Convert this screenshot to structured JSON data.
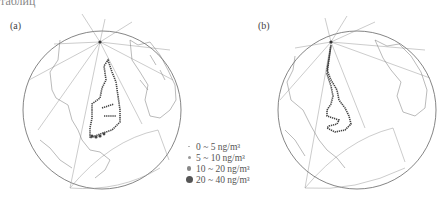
{
  "figure": {
    "top_cut_text": "таблиц",
    "panels": [
      {
        "label": "(a)"
      },
      {
        "label": "(b)"
      }
    ],
    "legend": {
      "items": [
        {
          "label": "0 ~ 5 ng/m³",
          "size": 1.5,
          "color": "#aaaaaa"
        },
        {
          "label": "5 ~ 10 ng/m³",
          "size": 3,
          "color": "#999999"
        },
        {
          "label": "10 ~ 20 ng/m³",
          "size": 4.5,
          "color": "#888888"
        },
        {
          "label": "20 ~ 40 ng/m³",
          "size": 7,
          "color": "#555555"
        }
      ]
    }
  }
}
